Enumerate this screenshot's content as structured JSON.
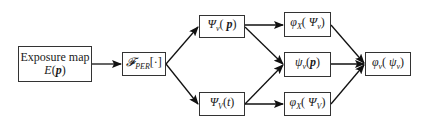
{
  "diagram": {
    "type": "flowchart",
    "nodes": [
      {
        "id": "exposure",
        "line1": "Exposure map",
        "line2_fn": "E",
        "line2_arg": "p"
      },
      {
        "id": "fper",
        "symbol": "𝓕",
        "subscript": "PER",
        "arg": "[·]"
      },
      {
        "id": "psi_v_p",
        "symbol": "Ψ",
        "subscript": "v",
        "arg": "p"
      },
      {
        "id": "psi_V_t",
        "symbol": "Ψ",
        "subscript": "V",
        "arg": "t"
      },
      {
        "id": "phiX_psi_v",
        "symbol": "φ",
        "subscript": "X",
        "inner_symbol": "Ψ",
        "inner_subscript": "v"
      },
      {
        "id": "psi_v_p_small",
        "symbol": "ψ",
        "subscript": "v",
        "arg": "p"
      },
      {
        "id": "phiX_psi_V",
        "symbol": "φ",
        "subscript": "X",
        "inner_symbol": "Ψ",
        "inner_subscript": "V"
      },
      {
        "id": "phi_v_psi_v",
        "symbol": "φ",
        "subscript": "v",
        "inner_symbol": "ψ",
        "inner_subscript": "v"
      }
    ],
    "edges": [
      {
        "from": "exposure",
        "to": "fper"
      },
      {
        "from": "fper",
        "to": "psi_v_p"
      },
      {
        "from": "fper",
        "to": "psi_V_t"
      },
      {
        "from": "psi_v_p",
        "to": "phiX_psi_v"
      },
      {
        "from": "psi_v_p",
        "to": "psi_v_p_small"
      },
      {
        "from": "psi_V_t",
        "to": "psi_v_p_small"
      },
      {
        "from": "psi_V_t",
        "to": "phiX_psi_V"
      },
      {
        "from": "phiX_psi_v",
        "to": "phi_v_psi_v"
      },
      {
        "from": "psi_v_p_small",
        "to": "phi_v_psi_v"
      },
      {
        "from": "phiX_psi_V",
        "to": "phi_v_psi_v"
      }
    ]
  },
  "labels": {
    "exposure_line1": "Exposure map",
    "exposure_fn": "E",
    "exposure_arg": "p",
    "fper_symbol": "𝓕",
    "fper_sub": "PER",
    "fper_arg": "[·]",
    "psi_upper": "Ψ",
    "psi_lower": "ψ",
    "phi": "φ",
    "sub_v": "v",
    "sub_V": "V",
    "sub_X": "X",
    "arg_p": "p",
    "arg_t": "t"
  }
}
